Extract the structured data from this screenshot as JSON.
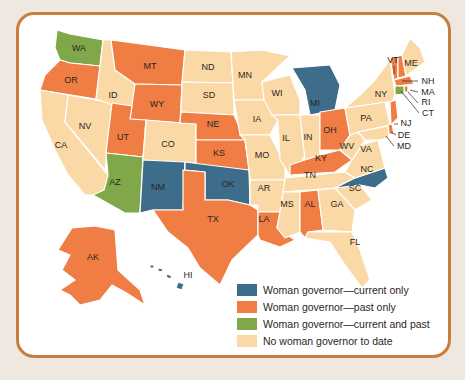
{
  "colors": {
    "current_only": "#3d6d8a",
    "past_only": "#ef7d44",
    "current_and_past": "#80a84a",
    "none": "#fbd9a6",
    "frame_border": "#c67f3e",
    "page_bg": "#efe8e1"
  },
  "legend": [
    {
      "key": "current_only",
      "label": "Woman governor—current only",
      "color": "#3d6d8a"
    },
    {
      "key": "past_only",
      "label": "Woman governor—past only",
      "color": "#ef7d44"
    },
    {
      "key": "current_and_past",
      "label": "Woman governor—current and past",
      "color": "#80a84a"
    },
    {
      "key": "none",
      "label": "No woman governor to date",
      "color": "#fbd9a6"
    }
  ],
  "states": {
    "WA": "current_and_past",
    "OR": "past_only",
    "CA": "none",
    "NV": "none",
    "ID": "none",
    "MT": "past_only",
    "WY": "past_only",
    "UT": "past_only",
    "AZ": "current_and_past",
    "CO": "none",
    "NM": "current_only",
    "ND": "none",
    "SD": "none",
    "NE": "past_only",
    "KS": "past_only",
    "OK": "current_only",
    "TX": "past_only",
    "MN": "none",
    "IA": "none",
    "MO": "none",
    "AR": "none",
    "LA": "past_only",
    "WI": "none",
    "IL": "none",
    "MI": "current_only",
    "IN": "none",
    "OH": "past_only",
    "KY": "past_only",
    "TN": "none",
    "MS": "none",
    "AL": "past_only",
    "GA": "none",
    "FL": "none",
    "SC": "none",
    "NC": "current_only",
    "VA": "none",
    "WV": "none",
    "PA": "none",
    "NY": "none",
    "VT": "past_only",
    "NH": "past_only",
    "ME": "none",
    "MA": "past_only",
    "RI": "past_only",
    "CT": "current_and_past",
    "NJ": "past_only",
    "DE": "past_only",
    "MD": "none",
    "AK": "past_only",
    "HI": "current_only"
  },
  "labels": {
    "WA": "WA",
    "OR": "OR",
    "CA": "CA",
    "NV": "NV",
    "ID": "ID",
    "MT": "MT",
    "WY": "WY",
    "UT": "UT",
    "AZ": "AZ",
    "CO": "CO",
    "NM": "NM",
    "ND": "ND",
    "SD": "SD",
    "NE": "NE",
    "KS": "KS",
    "OK": "OK",
    "TX": "TX",
    "MN": "MN",
    "IA": "IA",
    "MO": "MO",
    "AR": "AR",
    "LA": "LA",
    "WI": "WI",
    "IL": "IL",
    "MI": "MI",
    "IN": "IN",
    "OH": "OH",
    "KY": "KY",
    "TN": "TN",
    "MS": "MS",
    "AL": "AL",
    "GA": "GA",
    "FL": "FL",
    "SC": "SC",
    "NC": "NC",
    "VA": "VA",
    "WV": "WV",
    "PA": "PA",
    "NY": "NY",
    "VT": "VT",
    "NH": "NH",
    "ME": "ME",
    "MA": "MA",
    "RI": "RI",
    "CT": "CT",
    "NJ": "NJ",
    "DE": "DE",
    "MD": "MD",
    "AK": "AK",
    "HI": "HI"
  }
}
